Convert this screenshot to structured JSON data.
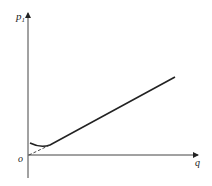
{
  "diagram": {
    "y_axis_label": "p",
    "y_axis_subscript": "1",
    "x_axis_label": "q",
    "origin_label": "o",
    "colors": {
      "line": "#222222",
      "background": "#ffffff"
    },
    "elements": [
      {
        "type": "axis",
        "name": "y-axis",
        "from": [
          28,
          178
        ],
        "to": [
          28,
          12
        ]
      },
      {
        "type": "axis",
        "name": "x-axis",
        "from": [
          28,
          155
        ],
        "to": [
          199,
          155
        ]
      },
      {
        "type": "curve",
        "name": "characteristic-curve",
        "description": "starts at y-axis, dips slightly, then rises linearly to the upper right"
      },
      {
        "type": "dashed-line",
        "name": "extrapolation-line",
        "description": "dashed extension of linear part down to the origin"
      }
    ]
  }
}
